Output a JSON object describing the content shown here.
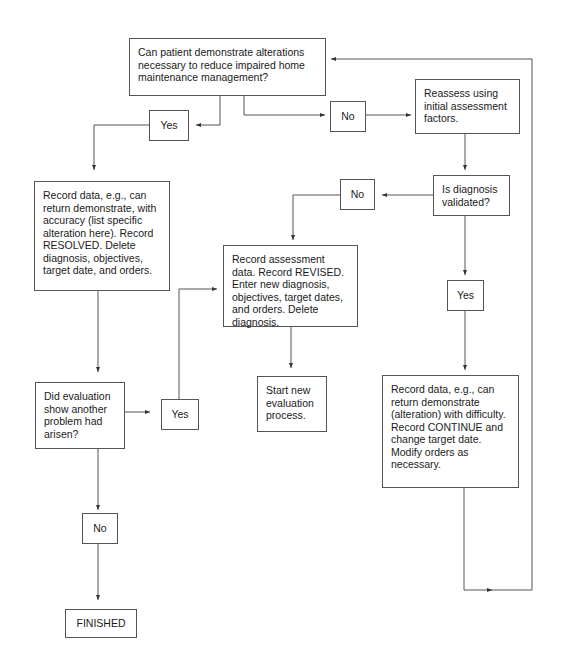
{
  "diagram": {
    "type": "flowchart",
    "nodes": {
      "question_alterations": "Can patient demonstrate alterations necessary to reduce impaired home maintenance management?",
      "yes_top": "Yes",
      "no_top": "No",
      "reassess": "Reassess using initial assessment factors.",
      "resolved": "Record data, e.g., can return demonstrate, with accuracy (list specific alteration here). Record RESOLVED. Delete diagnosis, objectives, target date, and orders.",
      "diagnosis_validated": "Is diagnosis validated?",
      "no_validated": "No",
      "yes_validated": "Yes",
      "revised": "Record assessment data. Record REVISED. Enter new diagnosis, objectives, target dates, and orders. Delete diagnosis.",
      "start_new": "Start new evaluation process.",
      "another_problem": "Did evaluation show another problem had arisen?",
      "yes_problem": "Yes",
      "no_problem": "No",
      "continue": "Record data, e.g., can return demonstrate (alteration) with difficulty. Record CONTINUE and change target date. Modify orders as necessary.",
      "finished": "FINISHED"
    },
    "edges": [
      {
        "from": "question_alterations",
        "to": "yes_top"
      },
      {
        "from": "question_alterations",
        "to": "no_top"
      },
      {
        "from": "yes_top",
        "to": "resolved"
      },
      {
        "from": "no_top",
        "to": "reassess"
      },
      {
        "from": "reassess",
        "to": "diagnosis_validated"
      },
      {
        "from": "diagnosis_validated",
        "to": "no_validated"
      },
      {
        "from": "diagnosis_validated",
        "to": "yes_validated"
      },
      {
        "from": "no_validated",
        "to": "revised"
      },
      {
        "from": "yes_validated",
        "to": "continue"
      },
      {
        "from": "revised",
        "to": "start_new"
      },
      {
        "from": "resolved",
        "to": "another_problem"
      },
      {
        "from": "another_problem",
        "to": "yes_problem"
      },
      {
        "from": "another_problem",
        "to": "no_problem"
      },
      {
        "from": "yes_problem",
        "to": "revised"
      },
      {
        "from": "no_problem",
        "to": "finished"
      },
      {
        "from": "continue",
        "to": "question_alterations"
      }
    ]
  }
}
